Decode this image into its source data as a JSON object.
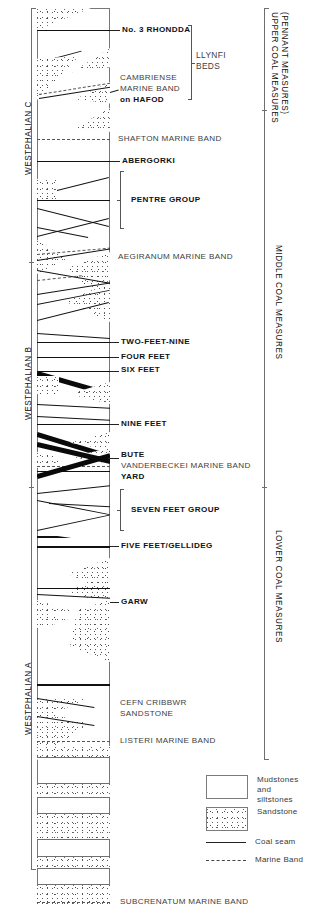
{
  "figure": {
    "column": {
      "left": 37,
      "right": 110,
      "top": 8,
      "bottom": 905
    }
  },
  "chronostratigraphy": {
    "axis_name": "westphalian-stages",
    "items": [
      {
        "label": "WESTPHALIAN C",
        "top": 8,
        "bottom": 262
      },
      {
        "label": "WESTPHALIAN B",
        "top": 262,
        "bottom": 487
      },
      {
        "label": "WESTPHALIAN A",
        "top": 487,
        "bottom": 870
      }
    ]
  },
  "lithostratigraphy": {
    "axis_name": "coal-measures-divisions",
    "items": [
      {
        "label": "UPPER COAL MEASURES",
        "sublabel": "(PENNANT MEASURES)",
        "top": 8,
        "bottom": 110
      },
      {
        "label": "MIDDLE COAL MEASURES",
        "sublabel": "",
        "top": 110,
        "bottom": 487
      },
      {
        "label": "LOWER COAL MEASURES",
        "sublabel": "",
        "top": 487,
        "bottom": 760
      }
    ]
  },
  "markers": [
    {
      "id": "no-3-rhondda",
      "label": "No. 3 RHONDDA",
      "y": 30,
      "style": "bold",
      "type": "coal"
    },
    {
      "id": "cambriense-marine-band",
      "label": "CAMBRIENSE",
      "y": 80,
      "style": "grey",
      "type": "marine"
    },
    {
      "id": "cambriense-line2",
      "label": "MARINE BAND",
      "y": 90,
      "style": "grey",
      "type": "marine"
    },
    {
      "id": "on-hafod",
      "label": "on  HAFOD",
      "y": 100,
      "style": "mixed",
      "type": "coal"
    },
    {
      "id": "shafton-marine-band",
      "label": "SHAFTON MARINE BAND",
      "y": 139,
      "style": "grey",
      "type": "marine"
    },
    {
      "id": "abergorki",
      "label": "ABERGORKI",
      "y": 161,
      "style": "bold",
      "type": "coal"
    },
    {
      "id": "pentre-group",
      "label": "PENTRE GROUP",
      "y": 200,
      "style": "bold",
      "type": "group"
    },
    {
      "id": "aegiranum-marine-band",
      "label": "AEGIRANUM MARINE BAND",
      "y": 257,
      "style": "grey",
      "type": "marine"
    },
    {
      "id": "two-feet-nine",
      "label": "TWO-FEET-NINE",
      "y": 342,
      "style": "bold",
      "type": "coal"
    },
    {
      "id": "four-feet",
      "label": "FOUR FEET",
      "y": 357,
      "style": "bold",
      "type": "coal"
    },
    {
      "id": "six-feet",
      "label": "SIX FEET",
      "y": 371,
      "style": "bold",
      "type": "coal"
    },
    {
      "id": "nine-feet",
      "label": "NINE FEET",
      "y": 424,
      "style": "bold",
      "type": "coal"
    },
    {
      "id": "bute",
      "label": "BUTE",
      "y": 455,
      "style": "bold",
      "type": "coal"
    },
    {
      "id": "vanderbeckei-marine-band",
      "label": "VANDERBECKEI MARINE BAND",
      "y": 466,
      "style": "grey",
      "type": "marine"
    },
    {
      "id": "yard",
      "label": "YARD",
      "y": 477,
      "style": "bold",
      "type": "coal"
    },
    {
      "id": "seven-feet-group",
      "label": "SEVEN FEET GROUP",
      "y": 510,
      "style": "bold",
      "type": "group"
    },
    {
      "id": "five-feet-gellideg",
      "label": "FIVE FEET/GELLIDEG",
      "y": 546,
      "style": "bold",
      "type": "coal"
    },
    {
      "id": "garw",
      "label": "GARW",
      "y": 602,
      "style": "bold",
      "type": "coal"
    },
    {
      "id": "cefn-cribbwr-sandstone",
      "label": "CEFN CRIBBWR",
      "y": 703,
      "style": "grey",
      "type": "sandstone"
    },
    {
      "id": "cefn-cribbwr-line2",
      "label": "SANDSTONE",
      "y": 714,
      "style": "grey",
      "type": "sandstone"
    },
    {
      "id": "listeri-marine-band",
      "label": "LISTERI MARINE BAND",
      "y": 741,
      "style": "grey",
      "type": "marine"
    },
    {
      "id": "subcrenatum-marine-band",
      "label": "SUBCRENATUM MARINE BAND",
      "y": 902,
      "style": "grey",
      "type": "marine"
    }
  ],
  "groups": [
    {
      "id": "llynfi-beds",
      "label_line1": "LLYNFI",
      "label_line2": "BEDS",
      "top": 30,
      "bottom": 100,
      "label_y": 55
    },
    {
      "id": "pentre-bracket",
      "label_line1": "",
      "label_line2": "",
      "top": 170,
      "bottom": 228,
      "label_y": 200
    },
    {
      "id": "sevenfeet-bracket",
      "label_line1": "",
      "label_line2": "",
      "top": 488,
      "bottom": 530,
      "label_y": 510
    }
  ],
  "legend": {
    "name": "lithology-key",
    "entries": [
      {
        "id": "mudstone",
        "swatch": "blank-box",
        "label": "Mudstones and\nsiltstones"
      },
      {
        "id": "sandstone",
        "swatch": "stipple-box",
        "label": "Sandstone"
      },
      {
        "id": "coal",
        "swatch": "solid-line",
        "label": "Coal seam"
      },
      {
        "id": "marine",
        "swatch": "dashed-line",
        "label": "Marine Band"
      }
    ]
  },
  "colors": {
    "ink": "#111111",
    "rule": "#6f6f6f",
    "grey_text": "#3a3a3a",
    "coal": "#0a0a0a",
    "paper": "#ffffff"
  }
}
